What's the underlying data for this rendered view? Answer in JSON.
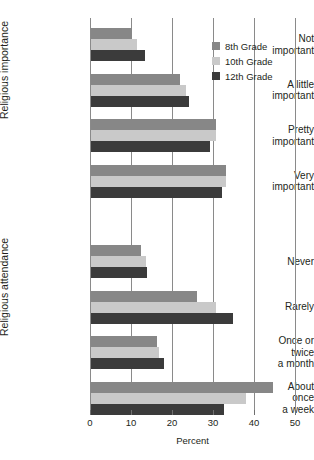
{
  "chart_data": {
    "type": "bar",
    "orientation": "horizontal",
    "title": "",
    "xlabel": "Percent",
    "ylabel": "",
    "xlim": [
      0,
      50
    ],
    "xticks": [
      0,
      10,
      20,
      30,
      40,
      50
    ],
    "xticklabels": [
      "0",
      "10",
      "20",
      "30",
      "40",
      "50"
    ],
    "grid": true,
    "grid_axis": "x",
    "legend_position": "upper right",
    "series": [
      {
        "name": "8th Grade",
        "color": "#878787"
      },
      {
        "name": "10th Grade",
        "color": "#c9c9c9"
      },
      {
        "name": "12th Grade",
        "color": "#3b3b3b"
      }
    ],
    "panels": [
      {
        "axis_title": "Religious importance",
        "categories": [
          "Not important",
          "A little important",
          "Pretty important",
          "Very important"
        ],
        "category_lines": [
          [
            "Not",
            "important"
          ],
          [
            "A little",
            "important"
          ],
          [
            "Pretty",
            "important"
          ],
          [
            "Very",
            "important"
          ]
        ],
        "values": {
          "8th Grade": [
            10.0,
            21.8,
            30.5,
            33.0
          ],
          "10th Grade": [
            11.1,
            23.2,
            30.5,
            33.0
          ],
          "12th Grade": [
            13.2,
            23.8,
            29.0,
            32.0
          ]
        }
      },
      {
        "axis_title": "Religious attendance",
        "categories": [
          "Never",
          "Rarely",
          "Once or twice a month",
          "About once a week"
        ],
        "category_lines": [
          [
            "Never"
          ],
          [
            "Rarely"
          ],
          [
            "Once or",
            "twice",
            "a month"
          ],
          [
            "About",
            "once",
            "a week"
          ]
        ],
        "values": {
          "8th Grade": [
            12.2,
            25.9,
            16.1,
            44.3
          ],
          "10th Grade": [
            13.4,
            30.5,
            16.6,
            37.8
          ],
          "12th Grade": [
            13.7,
            34.6,
            17.8,
            32.5
          ]
        }
      }
    ]
  },
  "legend": {
    "items": [
      {
        "label": "8th Grade",
        "color": "#878787"
      },
      {
        "label": "10th Grade",
        "color": "#c9c9c9"
      },
      {
        "label": "12th Grade",
        "color": "#3b3b3b"
      }
    ]
  },
  "axis": {
    "x_title": "Percent",
    "panel1_title": "Religious importance",
    "panel2_title": "Religious attendance"
  }
}
